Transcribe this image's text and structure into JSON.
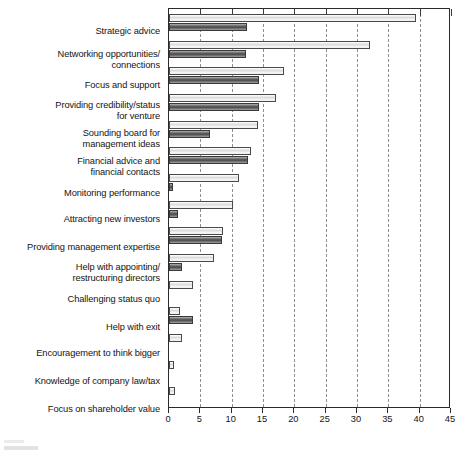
{
  "chart_data": {
    "type": "bar",
    "orientation": "horizontal",
    "title": "",
    "subtitle": "",
    "xlabel": "",
    "ylabel": "",
    "xlim": [
      0,
      45
    ],
    "xticks": [
      0,
      5,
      10,
      15,
      20,
      25,
      30,
      35,
      40,
      45
    ],
    "xtick_labels": [
      "0",
      "5",
      "10",
      "15",
      "20",
      "25",
      "30",
      "35",
      "40",
      "45"
    ],
    "grid": true,
    "grid_axis": "x",
    "legend": "none",
    "categories": [
      "Strategic advice",
      "Networking opportunities/\nconnections",
      "Focus and support",
      "Providing credibility/status\nfor venture",
      "Sounding board for\nmanagement ideas",
      "Financial advice and\nfinancial contacts",
      "Monitoring performance",
      "Attracting new investors",
      "Providing management expertise",
      "Help with appointing/\nrestructuring directors",
      "Challenging status quo",
      "Help with exit",
      "Encouragement to think bigger",
      "Knowledge of company law/tax",
      "Focus on shareholder value"
    ],
    "series": [
      {
        "name": "series-1-light",
        "style": "light",
        "values": [
          39.4,
          32.0,
          18.3,
          17.0,
          14.2,
          13.1,
          11.2,
          10.2,
          8.6,
          7.2,
          3.8,
          1.8,
          2.1,
          0.8,
          0.9
        ]
      },
      {
        "name": "series-2-dark",
        "style": "dark",
        "values": [
          12.4,
          12.3,
          14.4,
          14.3,
          6.5,
          12.6,
          0.6,
          1.4,
          8.5,
          2.1,
          0,
          3.9,
          0,
          0,
          0
        ]
      }
    ],
    "colors": {
      "light_fill": "#e8e8e8",
      "dark_fill": "#5e5e5e",
      "axis": "#2b2b2b",
      "grid": "#9a9a9a"
    }
  }
}
